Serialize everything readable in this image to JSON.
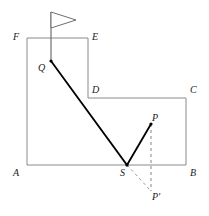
{
  "figure": {
    "kind": "geometry-diagram",
    "width": 209,
    "height": 216,
    "background_color": "#ffffff",
    "outline_color": "#8a8a8a",
    "path_color": "#000000",
    "dashed_color": "#9a9a9a",
    "label_color": "#1a1a1a"
  },
  "polygon": {
    "name": "room-outline",
    "vertices": [
      {
        "label": "F",
        "x": 27,
        "y": 38,
        "label_x": 13,
        "label_y": 32
      },
      {
        "label": "E",
        "x": 88,
        "y": 38,
        "label_x": 92,
        "label_y": 32
      },
      {
        "label": "D",
        "x": 88,
        "y": 98,
        "label_x": 92,
        "label_y": 85
      },
      {
        "label": "C",
        "x": 186,
        "y": 98,
        "label_x": 190,
        "label_y": 85
      },
      {
        "label": "B",
        "x": 186,
        "y": 165,
        "label_x": 190,
        "label_y": 168
      },
      {
        "label": "A",
        "x": 27,
        "y": 165,
        "label_x": 13,
        "label_y": 168
      }
    ]
  },
  "points": [
    {
      "label": "Q",
      "x": 51,
      "y": 61,
      "label_x": 38,
      "label_y": 63,
      "dot": true
    },
    {
      "label": "S",
      "x": 127,
      "y": 165,
      "label_x": 120,
      "label_y": 168,
      "dot": true
    },
    {
      "label": "P",
      "x": 151,
      "y": 124,
      "label_x": 152,
      "label_y": 113,
      "dot": true
    },
    {
      "label": "P'",
      "x": 151,
      "y": 191,
      "label_x": 152,
      "label_y": 192,
      "dot": false
    }
  ],
  "solid_path": {
    "name": "light-ray-path",
    "points": [
      {
        "x": 51,
        "y": 61
      },
      {
        "x": 127,
        "y": 165
      },
      {
        "x": 151,
        "y": 124
      }
    ]
  },
  "dashed_segments": [
    {
      "name": "p-to-p-prime",
      "x1": 151,
      "y1": 124,
      "x2": 151,
      "y2": 191
    },
    {
      "name": "s-to-p-prime",
      "x1": 127,
      "y1": 165,
      "x2": 151,
      "y2": 191
    }
  ],
  "flag": {
    "name": "flag-marker",
    "pole_x": 51,
    "pole_top_y": 12,
    "pole_bottom_y": 61,
    "pennant": {
      "tip_x": 76,
      "tip_y": 20,
      "top_y": 12,
      "bottom_y": 28
    }
  }
}
